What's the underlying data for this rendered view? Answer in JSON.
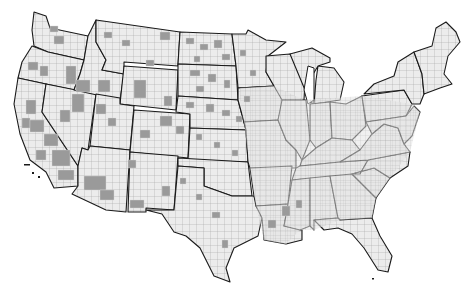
{
  "map": {
    "title": "",
    "subject": "United States counties",
    "colors": {
      "background": "#ffffff",
      "county_fill": "#ececec",
      "county_border": "#9c9c9c",
      "state_border": "#1a1a1a",
      "highlighted_county_fill": "#9a9a9a"
    },
    "legend": null,
    "regions_highlighted": [
      "California central valley & south",
      "Nevada north",
      "Oregon east",
      "Idaho south",
      "Montana scattered",
      "Wyoming central",
      "Utah scattered",
      "Colorado scattered",
      "Arizona south-central",
      "New Mexico scattered",
      "North Dakota",
      "South Dakota",
      "Nebraska",
      "Kansas scattered",
      "Texas west scattered",
      "Louisiana / Mississippi scattered"
    ]
  }
}
